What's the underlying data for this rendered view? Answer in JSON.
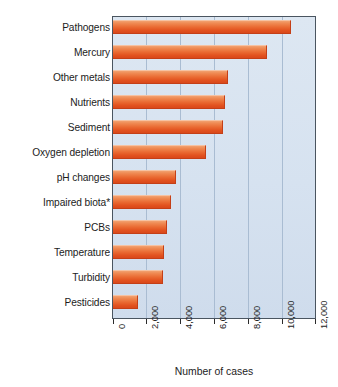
{
  "chart_data": {
    "type": "bar",
    "orientation": "horizontal",
    "title": "",
    "xlabel": "Number of cases",
    "ylabel": "",
    "xlim": [
      0,
      12000
    ],
    "xticks": [
      0,
      2000,
      4000,
      6000,
      8000,
      10000,
      12000
    ],
    "xtick_labels": [
      "0",
      "2,000",
      "4,000",
      "6,000",
      "8,000",
      "10,000",
      "12,000"
    ],
    "grid": true,
    "legend": false,
    "categories": [
      "Pathogens",
      "Mercury",
      "Other metals",
      "Nutrients",
      "Sediment",
      "Oxygen depletion",
      "pH changes",
      "Impaired biota*",
      "PCBs",
      "Temperature",
      "Turbidity",
      "Pesticides"
    ],
    "values": [
      10500,
      9100,
      6800,
      6600,
      6500,
      5500,
      3700,
      3400,
      3200,
      3000,
      2950,
      1500
    ],
    "bar_color_top": "#f2a170",
    "bar_color_bottom": "#d9481a",
    "plot_background": "#d8e3f0",
    "gridline_color": "#a9bcd2",
    "axis_color": "#4a5560",
    "footnote_marker": "*"
  }
}
